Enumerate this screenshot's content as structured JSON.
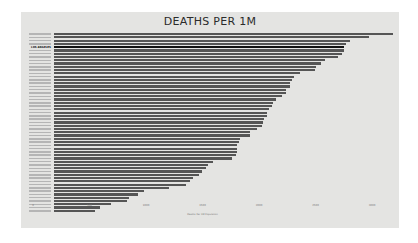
{
  "chart_data": {
    "type": "bar",
    "orientation": "horizontal",
    "title": "DEATHS PER 1M",
    "xlabel": "Deaths Per 1M Population",
    "ylabel": "",
    "xlim": [
      0,
      3000
    ],
    "xticks": [
      "0",
      "500",
      "1000",
      "1500",
      "2000",
      "2500",
      "3000"
    ],
    "grid": false,
    "legend": null,
    "highlighted_category": "LOS ANGELES",
    "categories": [
      "",
      "",
      "",
      "",
      "LOS ANGELES",
      "",
      "",
      "",
      "",
      "",
      "",
      "",
      "",
      "",
      "",
      "",
      "",
      "",
      "",
      "",
      "",
      "",
      "",
      "",
      "",
      "",
      "",
      "",
      "",
      "",
      "",
      "",
      "",
      "",
      "",
      "",
      "",
      "",
      "",
      "",
      "",
      "",
      "",
      "",
      "",
      "",
      "",
      "",
      "",
      "",
      "",
      "",
      "",
      "",
      ""
    ],
    "values": [
      3000,
      2786,
      2620,
      2583,
      2566,
      2566,
      2549,
      2513,
      2398,
      2363,
      2319,
      2310,
      2180,
      2124,
      2106,
      2088,
      2088,
      2053,
      2053,
      2018,
      1964,
      1938,
      1929,
      1903,
      1885,
      1885,
      1858,
      1850,
      1841,
      1797,
      1735,
      1735,
      1646,
      1637,
      1620,
      1620,
      1620,
      1611,
      1575,
      1407,
      1363,
      1345,
      1310,
      1283,
      1231,
      1204,
      1168,
      1018,
      796,
      743,
      664,
      646,
      504,
      407,
      363
    ]
  }
}
